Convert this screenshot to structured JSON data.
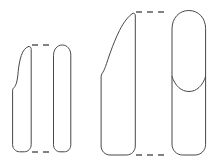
{
  "figure": {
    "title": "Comparative outline drawings of four elongated artefact profiles",
    "background_color": "#ffffff",
    "line_color": "#474747",
    "guide_color": "#5a5a5a",
    "canvas": {
      "width": 217,
      "height": 164
    },
    "groups": [
      {
        "id": "left-pair",
        "name": "left-specimen-pair",
        "guides": [
          {
            "id": "left-top-guide",
            "name": "top-alignment-guide",
            "orientation": "horizontal",
            "x1": 32,
            "y1": 45,
            "x2": 52,
            "y2": 45
          },
          {
            "id": "left-bottom-guide",
            "name": "bottom-alignment-guide",
            "orientation": "horizontal",
            "x1": 32,
            "y1": 152,
            "x2": 52,
            "y2": 152
          }
        ],
        "shapes": [
          {
            "id": "shape-1",
            "name": "tapered-blade-outline",
            "description": "narrow elongated profile with pointed upper tip, stepped left shoulder and rounded base",
            "path": "M 28.5 46.5 C 25.5 47.5 23.0 50.5 21.3 55.5 C 19.8 60.0 18.8 65.5 18.2 71.5 C 17.8 76.0 17.3 80.5 16.3 83.5 C 15.4 86.1 14.3 87.4 13.4 88.2 C 12.9 88.7 12.6 89.4 12.6 90.2 L 12.6 144.5 C 12.6 148.6 15.6 151.8 19.6 151.8 L 24.2 151.8 C 28.2 151.8 31.2 148.6 31.2 144.5 L 31.2 49.5 C 31.2 47.6 30.2 46.2 28.5 46.5 Z"
          },
          {
            "id": "shape-2",
            "name": "parallel-sided-blade-outline",
            "description": "straight-sided elongated profile with rounded dome top and rounded base",
            "path": "M 53.5 55.2 C 53.5 49.4 57.2 45.0 62.3 45.0 C 67.4 45.0 70.8 49.4 70.8 55.2 L 70.8 144.8 C 70.8 148.7 68.0 151.8 64.3 151.8 L 60.0 151.8 C 56.3 151.8 53.5 148.7 53.5 144.8 Z"
          }
        ]
      },
      {
        "id": "right-pair",
        "name": "right-specimen-pair",
        "guides": [
          {
            "id": "right-top-guide",
            "name": "top-alignment-guide",
            "orientation": "horizontal",
            "x1": 136,
            "y1": 12,
            "x2": 168,
            "y2": 12
          },
          {
            "id": "right-bottom-guide",
            "name": "bottom-alignment-guide",
            "orientation": "horizontal",
            "x1": 136,
            "y1": 155,
            "x2": 168,
            "y2": 155
          }
        ],
        "shapes": [
          {
            "id": "shape-3",
            "name": "large-tapered-blade-outline",
            "description": "large elongated profile with long curved pointed tip, concave left edge, stepped shoulder and rounded base",
            "path": "M 132.5 13.5 C 128.0 16.5 123.5 22.5 119.5 30.5 C 116.0 37.5 113.0 45.0 110.5 52.0 C 108.5 57.5 107.0 62.5 105.5 66.5 C 104.3 69.7 103.3 71.8 102.2 73.4 C 101.5 74.4 101.1 75.6 101.1 76.8 L 101.1 146.0 C 101.1 151.0 105.0 155.0 109.9 155.0 L 126.5 155.0 C 131.4 155.0 135.3 151.0 135.3 146.0 L 135.3 16.0 C 135.3 13.8 134.3 12.5 132.5 13.5 Z"
          },
          {
            "id": "shape-4",
            "name": "rounded-top-blade-outline",
            "description": "broad elongated profile with fully rounded dome top, internal transverse curved line and rounded base",
            "path": "M 172.0 28.5 C 172.0 18.0 179.2 10.5 188.8 10.5 C 198.4 10.5 205.6 18.0 205.6 28.5 L 205.6 144.5 C 205.6 150.3 200.9 155.0 195.1 155.0 L 182.5 155.0 C 176.7 155.0 172.0 150.3 172.0 144.5 Z"
          }
        ],
        "inner_lines": [
          {
            "id": "shape-4-bevel",
            "name": "internal-bevel-line",
            "parent": "shape-4",
            "path": "M 172.0 76.5 C 175.0 86.0 181.5 91.5 189.0 91.5 C 196.5 91.5 202.6 86.0 205.6 76.5"
          }
        ]
      }
    ]
  }
}
